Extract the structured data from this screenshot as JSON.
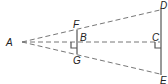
{
  "diagram": {
    "type": "geometry",
    "points": {
      "A": {
        "label": "A",
        "x": 18,
        "y": 42
      },
      "B": {
        "label": "B",
        "x": 77,
        "y": 42
      },
      "C": {
        "label": "C",
        "x": 160,
        "y": 42
      },
      "D": {
        "label": "D",
        "x": 160,
        "y": 10
      },
      "E": {
        "label": "E",
        "x": 160,
        "y": 74
      },
      "F": {
        "label": "F",
        "x": 77,
        "y": 31
      },
      "G": {
        "label": "G",
        "x": 77,
        "y": 53
      }
    },
    "solid_segments": [
      "FG",
      "DE"
    ],
    "dashed_segments": [
      "AD",
      "AC",
      "AE"
    ],
    "right_angles": [
      "B",
      "C"
    ],
    "colors": {
      "line": "#555555",
      "label": "#222222"
    }
  }
}
